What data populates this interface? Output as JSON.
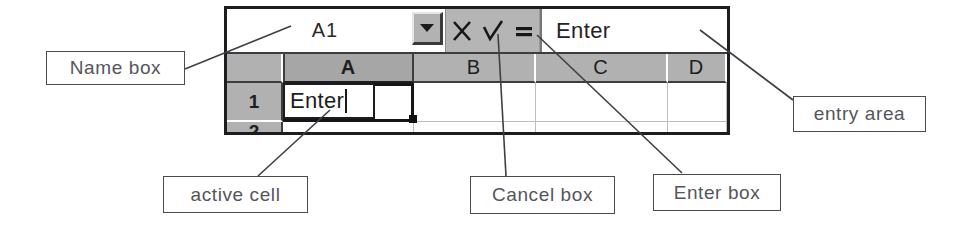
{
  "diagram": {
    "callouts": [
      {
        "id": "name-box",
        "label": "Name box"
      },
      {
        "id": "entry-area",
        "label": "entry area"
      },
      {
        "id": "active-cell",
        "label": "active cell"
      },
      {
        "id": "cancel-box",
        "label": "Cancel box"
      },
      {
        "id": "enter-box",
        "label": "Enter box"
      }
    ]
  },
  "spreadsheet": {
    "name_box": {
      "value": "A1",
      "placeholder": "A1",
      "dropdown_icon": "chevron-down-icon"
    },
    "buttons": [
      {
        "id": "cancel",
        "icon": "x-cross-icon",
        "label": "X"
      },
      {
        "id": "enter",
        "icon": "check-mark-icon",
        "label": "✓"
      },
      {
        "id": "equals",
        "icon": "equals-icon",
        "label": "="
      }
    ],
    "entry_area": {
      "value": "Enter",
      "placeholder": ""
    },
    "column_headers": [
      "A",
      "B",
      "C",
      "D"
    ],
    "selected_column": "A",
    "row_headers": [
      "1",
      "2"
    ],
    "rows": [
      {
        "header": "1",
        "cells": [
          "Enter",
          "",
          "",
          ""
        ]
      },
      {
        "header": "2",
        "cells": [
          "",
          "",
          "",
          ""
        ]
      }
    ],
    "active_cell": {
      "reference": "A1",
      "editing_value": "Enter",
      "is_editing": true
    }
  },
  "colors": {
    "header_gray": "#b1b1b1",
    "bar_gray": "#b5b5b5",
    "border_dark": "#1d1d1f",
    "gridline": "#bdbdbd",
    "callout_stroke": "#4a4a50",
    "callout_text": "#55555c"
  }
}
